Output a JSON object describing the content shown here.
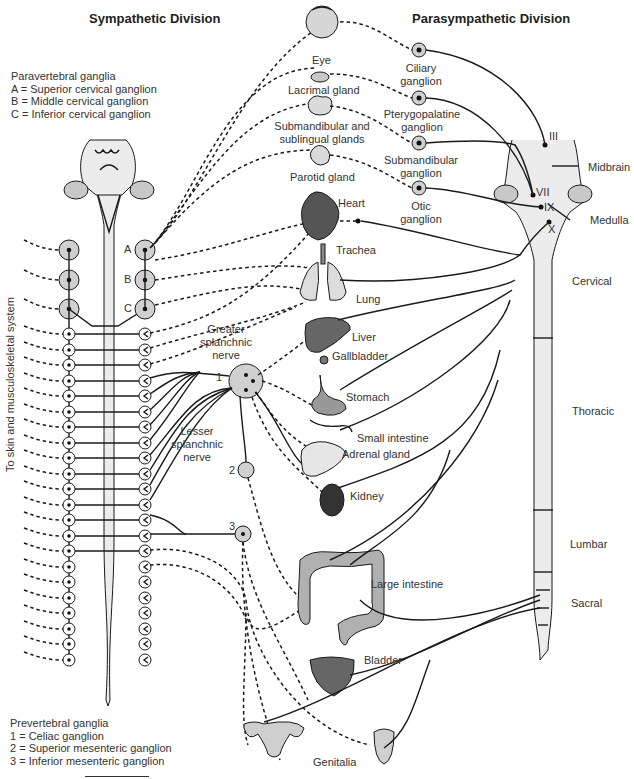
{
  "titles": {
    "sympathetic": "Sympathetic Division",
    "parasympathetic": "Parasympathetic Division"
  },
  "paravertebral_legend": {
    "heading": "Paravertebral ganglia",
    "items": [
      "A = Superior cervical ganglion",
      "B = Middle cervical ganglion",
      "C = Inferior cervical ganglion"
    ]
  },
  "prevertebral_legend": {
    "heading": "Prevertebral ganglia",
    "items": [
      "1 = Celiac ganglion",
      "2 = Superior mesenteric ganglion",
      "3 = Inferior mesenteric ganglion"
    ]
  },
  "side_label": "To skin and musculoskeletal system",
  "ganglion_letters": [
    "A",
    "B",
    "C"
  ],
  "prevertebral_numbers": [
    "1",
    "2",
    "3"
  ],
  "nerve_labels": {
    "greater": [
      "Greater",
      "splanchnic",
      "nerve"
    ],
    "lesser": [
      "Lesser",
      "splanchnic",
      "nerve"
    ]
  },
  "organs": {
    "eye": "Eye",
    "lacrimal": "Lacrimal gland",
    "submandibular": [
      "Submandibular and",
      "sublingual glands"
    ],
    "parotid": "Parotid gland",
    "heart": "Heart",
    "trachea": "Trachea",
    "lung": "Lung",
    "liver": "Liver",
    "gallbladder": "Gallbladder",
    "stomach": "Stomach",
    "small_intestine": "Small intestine",
    "adrenal": "Adrenal gland",
    "kidney": "Kidney",
    "large_intestine": "Large intestine",
    "bladder": "Bladder",
    "genitalia": "Genitalia"
  },
  "parasympathetic_ganglia": {
    "ciliary": [
      "Ciliary",
      "ganglion"
    ],
    "pterygopalatine": [
      "Pterygopalatine",
      "ganglion"
    ],
    "submandibular": [
      "Submandibular",
      "ganglion"
    ],
    "otic": [
      "Otic",
      "ganglion"
    ]
  },
  "cranial_nerves": [
    "III",
    "VII",
    "IX",
    "X"
  ],
  "brain_labels": {
    "midbrain": "Midbrain",
    "medulla": "Medulla"
  },
  "spinal_regions": [
    "Cervical",
    "Thoracic",
    "Lumbar",
    "Sacral"
  ],
  "colors": {
    "line": "#1a1a1a",
    "ganglion_fill": "#d0d0d0",
    "cord_fill": "#ececec",
    "organ_dark": "#555555",
    "organ_mid": "#9a9a9a",
    "organ_light": "#dcdcdc"
  }
}
